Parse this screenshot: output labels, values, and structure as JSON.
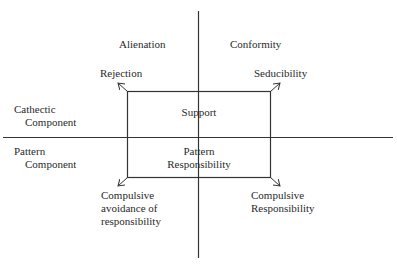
{
  "diagram": {
    "quadrants": {
      "top_left": "Alienation",
      "top_right": "Conformity"
    },
    "axes": {
      "upper_left_label": [
        "Cathectic",
        "Component"
      ],
      "lower_left_label": [
        "Pattern",
        "Component"
      ]
    },
    "box": {
      "upper": "Support",
      "lower": [
        "Pattern",
        "Responsibility"
      ]
    },
    "corners": {
      "top_left": "Rejection",
      "top_right": "Seducibility",
      "bottom_left": [
        "Compulsive",
        "avoidance of",
        "responsibility"
      ],
      "bottom_right": [
        "Compulsive",
        "Responsibility"
      ]
    },
    "colors": {
      "line": "#333333",
      "background": "#ffffff"
    }
  }
}
